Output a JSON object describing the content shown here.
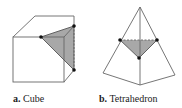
{
  "figure": {
    "panels": [
      {
        "id": "a",
        "letter": "a.",
        "name": "Cube",
        "shape": "cube",
        "cross_section": "triangle",
        "marked_vertices": 3
      },
      {
        "id": "b",
        "letter": "b.",
        "name": "Tetrahedron",
        "shape": "tetrahedron",
        "cross_section": "triangle",
        "marked_vertices": 3
      }
    ],
    "colors": {
      "edge": "#555555",
      "fill": "#a8a8a8",
      "dot": "#111111",
      "background": "#ffffff"
    }
  }
}
